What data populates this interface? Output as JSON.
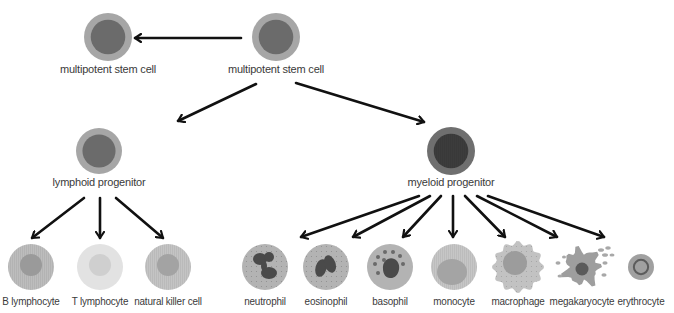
{
  "diagram": {
    "title": "",
    "colors": {
      "arrow": "#111111",
      "label": "#3a3a3a",
      "stem_outer": "#a6a6a6",
      "stem_inner": "#6b6b6b",
      "myeloid_outer": "#6f6f6f",
      "myeloid_inner": "#3c3c3c",
      "granulocyte_body": "#b3b3b3",
      "nucleus_dark": "#4a4a4a",
      "b_lymph_outer": "#bdbdbd",
      "b_lymph_inner": "#9a9a9a",
      "t_lymph_outer": "#e2e2e2",
      "t_lymph_inner": "#cfcfcf",
      "nk_outer": "#c4c4c4",
      "nk_inner": "#a3a3a3",
      "monocyte_outer": "#c6c6c6",
      "monocyte_inner": "#a4a4a4",
      "macrophage_body": "#c2c2c2",
      "macrophage_inner": "#9c9c9c",
      "megakaryocyte_body": "#9e9e9e",
      "megakaryocyte_nucleus": "#5a5a5a",
      "platelet": "#a8a8a8",
      "erythrocyte_outer": "#a0a0a0",
      "erythrocyte_ring": "#5c5c5c"
    },
    "nodes": [
      {
        "id": "stem-left",
        "label": "multipotent stem cell",
        "kind": "stem"
      },
      {
        "id": "stem-main",
        "label": "multipotent stem cell",
        "kind": "stem"
      },
      {
        "id": "lymphoid",
        "label": "lymphoid progenitor",
        "kind": "stem"
      },
      {
        "id": "myeloid",
        "label": "myeloid progenitor",
        "kind": "myeloid"
      },
      {
        "id": "b-lymphocyte",
        "label": "B lymphocyte",
        "kind": "b"
      },
      {
        "id": "t-lymphocyte",
        "label": "T lymphocyte",
        "kind": "t"
      },
      {
        "id": "nk-cell",
        "label": "natural killer cell",
        "kind": "nk"
      },
      {
        "id": "neutrophil",
        "label": "neutrophil",
        "kind": "neutrophil"
      },
      {
        "id": "eosinophil",
        "label": "eosinophil",
        "kind": "eosinophil"
      },
      {
        "id": "basophil",
        "label": "basophil",
        "kind": "basophil"
      },
      {
        "id": "monocyte",
        "label": "monocyte",
        "kind": "monocyte"
      },
      {
        "id": "macrophage",
        "label": "macrophage",
        "kind": "macrophage"
      },
      {
        "id": "megakaryocyte",
        "label": "megakaryocyte",
        "kind": "megakaryocyte"
      },
      {
        "id": "erythrocyte",
        "label": "erythrocyte",
        "kind": "erythrocyte"
      }
    ],
    "edges": [
      {
        "from": "stem-main",
        "to": "stem-left"
      },
      {
        "from": "stem-main",
        "to": "lymphoid"
      },
      {
        "from": "stem-main",
        "to": "myeloid"
      },
      {
        "from": "lymphoid",
        "to": "b-lymphocyte"
      },
      {
        "from": "lymphoid",
        "to": "t-lymphocyte"
      },
      {
        "from": "lymphoid",
        "to": "nk-cell"
      },
      {
        "from": "myeloid",
        "to": "neutrophil"
      },
      {
        "from": "myeloid",
        "to": "eosinophil"
      },
      {
        "from": "myeloid",
        "to": "basophil"
      },
      {
        "from": "myeloid",
        "to": "monocyte"
      },
      {
        "from": "myeloid",
        "to": "macrophage"
      },
      {
        "from": "myeloid",
        "to": "megakaryocyte"
      },
      {
        "from": "myeloid",
        "to": "erythrocyte"
      }
    ]
  }
}
